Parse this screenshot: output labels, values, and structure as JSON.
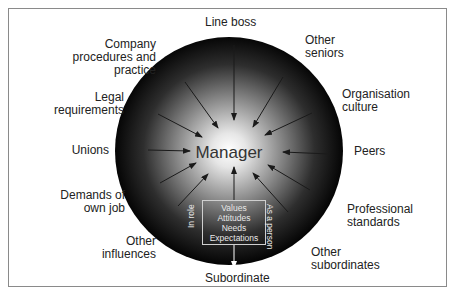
{
  "diagram": {
    "center": "Manager",
    "box_lines": [
      "Values",
      "Attitudes",
      "Needs",
      "Expectations"
    ],
    "side_labels": {
      "left": "In role",
      "right": "As a person"
    },
    "output": "Subordinate",
    "influences": [
      {
        "id": "line-boss",
        "label": "Line boss"
      },
      {
        "id": "other-seniors",
        "label": "Other seniors",
        "lines": [
          "Other",
          "seniors"
        ]
      },
      {
        "id": "organisation-culture",
        "label": "Organisation culture",
        "lines": [
          "Organisation",
          "culture"
        ]
      },
      {
        "id": "peers",
        "label": "Peers"
      },
      {
        "id": "professional-standards",
        "label": "Professional standards",
        "lines": [
          "Professional",
          "standards"
        ]
      },
      {
        "id": "other-subordinates",
        "label": "Other subordinates",
        "lines": [
          "Other",
          "subordinates"
        ]
      },
      {
        "id": "other-influences",
        "label": "Other influences",
        "lines": [
          "Other",
          "influences"
        ]
      },
      {
        "id": "demands-own-job",
        "label": "Demands of own job",
        "lines": [
          "Demands of",
          "own job"
        ]
      },
      {
        "id": "unions",
        "label": "Unions"
      },
      {
        "id": "legal-requirements",
        "label": "Legal requirements",
        "lines": [
          "Legal",
          "requirements"
        ]
      },
      {
        "id": "company-procedures",
        "label": "Company procedures and practice",
        "lines": [
          "Company",
          "procedures and",
          "practice"
        ]
      }
    ],
    "colors": {
      "circle_edge": "#0a0a0a",
      "circle_center": "#ffffff",
      "arrow": "#1a1a1a",
      "frame": "#8a8a8a"
    }
  }
}
